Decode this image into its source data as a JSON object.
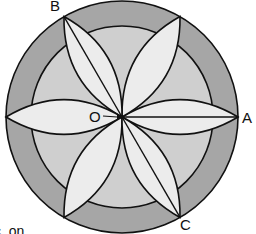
{
  "diagram": {
    "center": {
      "x": 122,
      "y": 117
    },
    "outer_radius": 116,
    "inner_radius": 91,
    "colors": {
      "ring": "#a6a6a6",
      "inner_disc": "#cfcfcf",
      "petal": "#ececec",
      "stroke": "#111111"
    },
    "petal_angles_deg": [
      0,
      60,
      120,
      180,
      240,
      300
    ],
    "labels": {
      "O": "O",
      "A": "A",
      "B": "B",
      "C": "C"
    },
    "caption_fragment": "c. on"
  }
}
